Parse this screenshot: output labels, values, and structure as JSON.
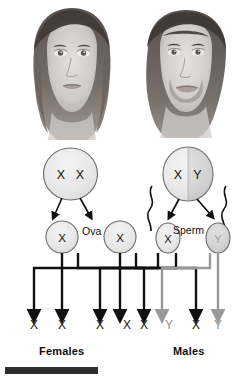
{
  "diagram": {
    "portraits": [
      {
        "name": "female-portrait",
        "alt": "Drawing of a woman's face"
      },
      {
        "name": "male-portrait",
        "alt": "Drawing of a man's face"
      }
    ],
    "parents": [
      {
        "id": "mother",
        "genotype": "X X",
        "allele_left": "X",
        "allele_right": "X",
        "sex": "female"
      },
      {
        "id": "father",
        "genotype": "X Y",
        "allele_left": "X",
        "allele_right": "Y",
        "sex": "male"
      }
    ],
    "gamete_labels": {
      "ova": "Ova",
      "sperm": "Sperm"
    },
    "gametes": [
      {
        "id": "ovum-1",
        "allele": "X",
        "type": "ovum"
      },
      {
        "id": "ovum-2",
        "allele": "X",
        "type": "ovum"
      },
      {
        "id": "sperm-x",
        "allele": "X",
        "type": "sperm"
      },
      {
        "id": "sperm-y",
        "allele": "Y",
        "type": "sperm"
      }
    ],
    "offspring": [
      {
        "id": "offspring-1",
        "left": "X",
        "right": "X",
        "sex": "female"
      },
      {
        "id": "offspring-2",
        "left": "X",
        "right": "X",
        "sex": "female"
      },
      {
        "id": "offspring-3",
        "left": "X",
        "right": "Y",
        "sex": "male"
      },
      {
        "id": "offspring-4",
        "left": "X",
        "right": "Y",
        "sex": "male"
      }
    ],
    "sex_labels": {
      "females": "Females",
      "males": "Males"
    },
    "colors": {
      "x_line": "#111111",
      "y_line": "#9a9a9a",
      "cell_fill": "#e9e9e9",
      "cell_fill_dark": "#d2d2d2",
      "outline": "#555555",
      "bottom_bar": "#2e2e2e"
    }
  }
}
